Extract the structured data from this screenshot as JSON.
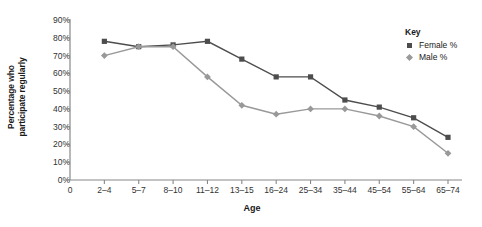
{
  "chart_data": {
    "type": "line",
    "title": "",
    "xlabel": "Age",
    "ylabel": "Percentage who participate regularly",
    "ylabel_line1": "Percentage who",
    "ylabel_line2": "participate regularly",
    "categories": [
      "0",
      "2–4",
      "5–7",
      "8–10",
      "11–12",
      "13–15",
      "16–24",
      "25–34",
      "35–44",
      "45–54",
      "55–64",
      "65–74"
    ],
    "ytick_labels": [
      "90%",
      "80%",
      "70%",
      "60%",
      "50%",
      "40%",
      "30%",
      "20%",
      "10%",
      "0%"
    ],
    "ylim": [
      0,
      90
    ],
    "ytick_step": 10,
    "grid": false,
    "legend_position": "right",
    "series": [
      {
        "name": "Female %",
        "color": "#4d4d4d",
        "marker": "square",
        "x": [
          "2–4",
          "5–7",
          "8–10",
          "11–12",
          "13–15",
          "16–24",
          "25–34",
          "35–44",
          "45–54",
          "55–64",
          "65–74"
        ],
        "values": [
          78,
          75,
          76,
          78,
          68,
          58,
          58,
          45,
          41,
          35,
          24
        ]
      },
      {
        "name": "Male %",
        "color": "#999999",
        "marker": "diamond",
        "x": [
          "2–4",
          "5–7",
          "8–10",
          "11–12",
          "13–15",
          "16–24",
          "25–34",
          "35–44",
          "45–54",
          "55–64",
          "65–74"
        ],
        "values": [
          70,
          75,
          75,
          58,
          42,
          37,
          40,
          40,
          36,
          30,
          15
        ]
      }
    ]
  },
  "legend": {
    "title": "Key",
    "entries": [
      {
        "label": "Female %"
      },
      {
        "label": "Male %"
      }
    ]
  }
}
